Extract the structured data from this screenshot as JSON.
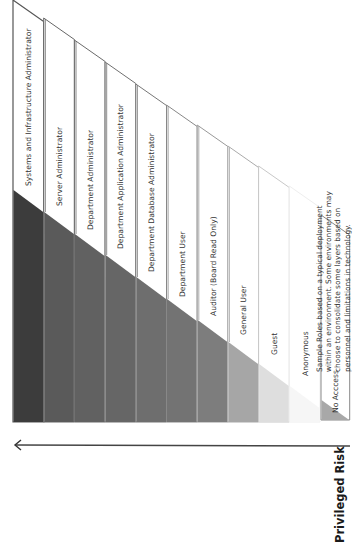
{
  "diagram": {
    "axis_title": "Privileged Risk",
    "note_lines": [
      "Sample Roles based on a typical deployment",
      "within an environment. Some environments may",
      "choose to consolidate some layers based on",
      "personnel and limitations in technology."
    ],
    "roles": [
      {
        "label": "Systems and Infrastructure Administrator",
        "shade": "#3c3c3c",
        "border": "#555555"
      },
      {
        "label": "Server Administrator",
        "shade": "#5a5a5a",
        "border": "#666666"
      },
      {
        "label": "Department Administrator",
        "shade": "#616161",
        "border": "#6a6a6a"
      },
      {
        "label": "Department Application Administrator",
        "shade": "#666666",
        "border": "#707070"
      },
      {
        "label": "Department Database Administrator",
        "shade": "#6e6e6e",
        "border": "#777777"
      },
      {
        "label": "Department User",
        "shade": "#737373",
        "border": "#888888"
      },
      {
        "label": "Auditor (Board Read Only)",
        "shade": "#7d7d7d",
        "border": "#999999"
      },
      {
        "label": "General User",
        "shade": "#a6a6a6",
        "border": "#aaaaaa"
      },
      {
        "label": "Guest",
        "shade": "#dedede",
        "border": "#c8c8c8"
      },
      {
        "label": "Anonymous",
        "shade": "#f6f6f6",
        "border": "#eeeeee"
      },
      {
        "label": "No Acccess",
        "shade": "#a8a8a8",
        "border": "#888888"
      }
    ],
    "colors": {
      "arrow": "#444444",
      "diagonal_edge": "#777777"
    }
  }
}
